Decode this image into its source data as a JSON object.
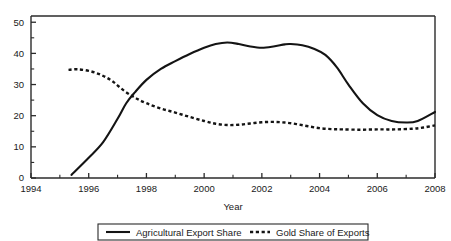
{
  "chart_data": {
    "type": "line",
    "title": "",
    "xlabel": "Year",
    "ylabel": "",
    "xlim": [
      1994,
      2008
    ],
    "ylim": [
      0,
      52
    ],
    "grid": false,
    "legend_position": "bottom",
    "x_ticks": [
      1994,
      1996,
      1998,
      2000,
      2002,
      2004,
      2006,
      2008
    ],
    "x_tick_labels": [
      "1994",
      "1996",
      "1998",
      "2000",
      "2002",
      "2004",
      "2006",
      "2008"
    ],
    "x_minor_ticks": [
      1995,
      1997,
      1999,
      2001,
      2003,
      2005,
      2007
    ],
    "y_ticks": [
      0,
      10,
      20,
      30,
      40,
      50
    ],
    "y_tick_labels": [
      "0",
      "10",
      "20",
      "30",
      "40",
      "50"
    ],
    "y_minor_ticks": [
      5,
      15,
      25,
      35,
      45
    ],
    "series": [
      {
        "name": "Agricultural Export Share",
        "style": "solid",
        "color": "#141414",
        "x": [
          1995.4,
          1996.0,
          1996.5,
          1997.0,
          1997.3,
          1997.6,
          1998.0,
          1998.5,
          1999.0,
          1999.5,
          2000.0,
          2000.4,
          2000.8,
          2001.2,
          2001.6,
          2002.0,
          2002.4,
          2002.8,
          2003.0,
          2003.4,
          2003.8,
          2004.2,
          2004.6,
          2005.0,
          2005.5,
          2006.0,
          2006.5,
          2007.0,
          2007.4,
          2008.0
        ],
        "y": [
          1.0,
          6.5,
          11.5,
          19.0,
          24.0,
          27.5,
          31.5,
          35.0,
          37.5,
          39.8,
          41.8,
          43.0,
          43.5,
          43.0,
          42.2,
          41.8,
          42.2,
          42.9,
          43.0,
          42.6,
          41.5,
          39.5,
          35.5,
          30.0,
          24.0,
          20.2,
          18.3,
          17.8,
          18.3,
          21.2
        ]
      },
      {
        "name": "Gold Share of Exports",
        "style": "dashed",
        "color": "#141414",
        "x": [
          1995.3,
          1995.6,
          1996.0,
          1996.4,
          1996.8,
          1997.2,
          1997.6,
          1998.0,
          1998.5,
          1999.0,
          1999.5,
          2000.0,
          2000.4,
          2000.8,
          2001.2,
          2001.6,
          2002.0,
          2002.4,
          2002.8,
          2003.2,
          2003.6,
          2004.0,
          2004.4,
          2004.8,
          2005.4,
          2006.0,
          2006.6,
          2007.2,
          2007.6,
          2008.0
        ],
        "y": [
          34.7,
          34.9,
          34.4,
          33.2,
          31.2,
          28.2,
          25.8,
          24.0,
          22.3,
          21.0,
          19.6,
          18.3,
          17.4,
          17.0,
          17.1,
          17.5,
          17.9,
          18.0,
          17.8,
          17.3,
          16.6,
          16.0,
          15.7,
          15.6,
          15.5,
          15.6,
          15.6,
          15.8,
          16.2,
          16.9
        ]
      }
    ]
  },
  "legend": {
    "items": [
      {
        "label": "Agricultural Export Share",
        "style": "solid"
      },
      {
        "label": "Gold Share of Exports",
        "style": "dashed"
      }
    ]
  }
}
